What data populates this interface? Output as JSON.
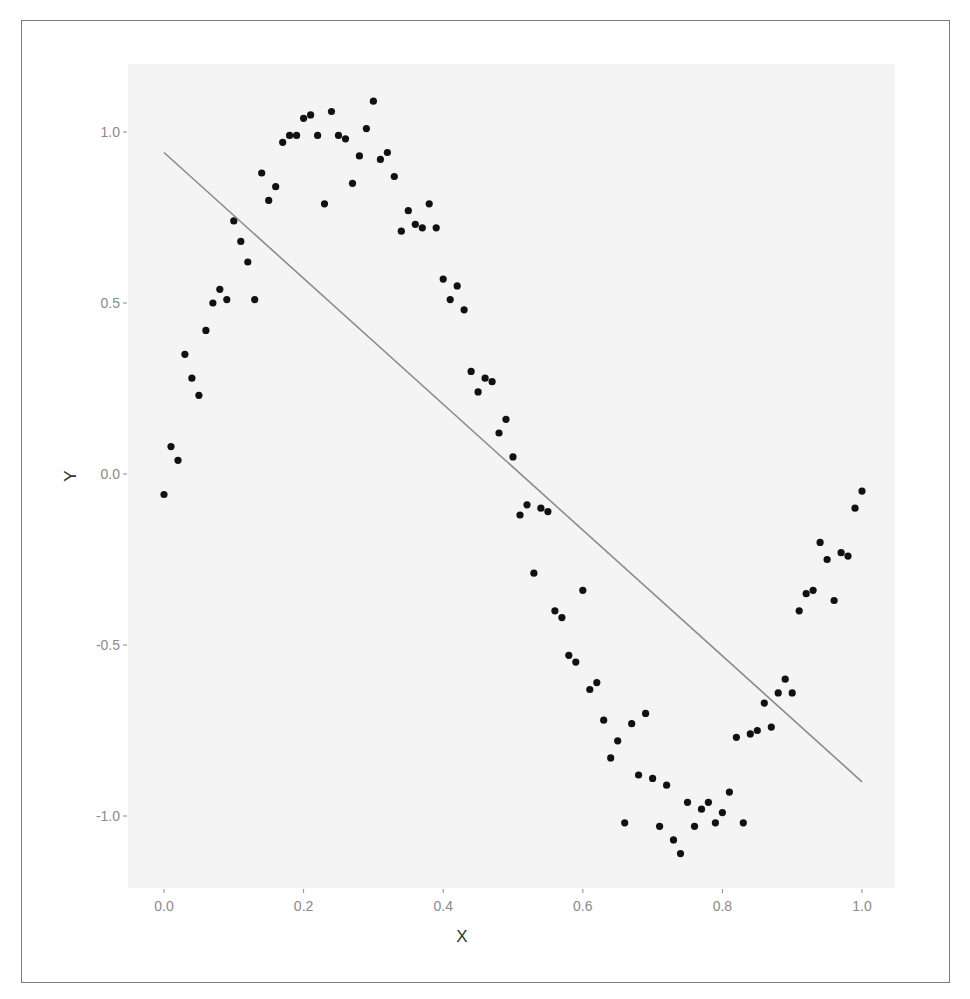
{
  "chart_data": {
    "type": "scatter",
    "title": "",
    "xlabel": "X",
    "ylabel": "Y",
    "xlim": [
      -0.05,
      1.05
    ],
    "ylim": [
      -1.21,
      1.2
    ],
    "xticks": [
      0.0,
      0.2,
      0.4,
      0.6,
      0.8,
      1.0
    ],
    "xtick_labels": [
      "0.0",
      "0.2",
      "0.4",
      "0.6",
      "0.8",
      "1.0"
    ],
    "yticks": [
      -1.0,
      -0.5,
      0.0,
      0.5,
      1.0
    ],
    "ytick_labels": [
      "-1.0",
      "-0.5",
      "0.0",
      "0.5",
      "1.0"
    ],
    "grid": false,
    "legend": null,
    "panel_background": "#f4f4f4",
    "point_color": "#111111",
    "line_color": "#8c8c8c",
    "series": [
      {
        "name": "points",
        "type": "scatter",
        "x": [
          0.0,
          0.01,
          0.02,
          0.03,
          0.04,
          0.05,
          0.06,
          0.07,
          0.08,
          0.09,
          0.1,
          0.11,
          0.12,
          0.13,
          0.14,
          0.15,
          0.16,
          0.17,
          0.18,
          0.19,
          0.2,
          0.21,
          0.22,
          0.23,
          0.24,
          0.25,
          0.26,
          0.27,
          0.28,
          0.29,
          0.3,
          0.31,
          0.32,
          0.33,
          0.34,
          0.35,
          0.36,
          0.37,
          0.38,
          0.39,
          0.4,
          0.41,
          0.42,
          0.43,
          0.44,
          0.45,
          0.46,
          0.47,
          0.48,
          0.49,
          0.5,
          0.51,
          0.52,
          0.53,
          0.54,
          0.55,
          0.56,
          0.57,
          0.58,
          0.59,
          0.6,
          0.61,
          0.62,
          0.63,
          0.64,
          0.65,
          0.66,
          0.67,
          0.68,
          0.69,
          0.7,
          0.71,
          0.72,
          0.73,
          0.74,
          0.75,
          0.76,
          0.77,
          0.78,
          0.79,
          0.8,
          0.81,
          0.82,
          0.83,
          0.84,
          0.85,
          0.86,
          0.87,
          0.88,
          0.89,
          0.9,
          0.91,
          0.92,
          0.93,
          0.94,
          0.95,
          0.96,
          0.97,
          0.98,
          0.99,
          1.0
        ],
        "y": [
          -0.06,
          0.08,
          0.04,
          0.35,
          0.28,
          0.23,
          0.42,
          0.5,
          0.54,
          0.51,
          0.74,
          0.68,
          0.62,
          0.51,
          0.88,
          0.8,
          0.84,
          0.97,
          0.99,
          0.99,
          1.04,
          1.05,
          0.99,
          0.79,
          1.06,
          0.99,
          0.98,
          0.85,
          0.93,
          1.01,
          1.09,
          0.92,
          0.94,
          0.87,
          0.71,
          0.77,
          0.73,
          0.72,
          0.79,
          0.72,
          0.57,
          0.51,
          0.55,
          0.48,
          0.3,
          0.24,
          0.28,
          0.27,
          0.12,
          0.16,
          0.05,
          -0.12,
          -0.09,
          -0.29,
          -0.1,
          -0.11,
          -0.4,
          -0.42,
          -0.53,
          -0.55,
          -0.34,
          -0.63,
          -0.61,
          -0.72,
          -0.83,
          -0.78,
          -1.02,
          -0.73,
          -0.88,
          -0.7,
          -0.89,
          -1.03,
          -0.91,
          -1.07,
          -1.11,
          -0.96,
          -1.03,
          -0.98,
          -0.96,
          -1.02,
          -0.99,
          -0.93,
          -0.77,
          -1.02,
          -0.76,
          -0.75,
          -0.67,
          -0.74,
          -0.64,
          -0.6,
          -0.64,
          -0.4,
          -0.35,
          -0.34,
          -0.2,
          -0.25,
          -0.37,
          -0.23,
          -0.24,
          -0.1,
          -0.05
        ]
      },
      {
        "name": "linear fit",
        "type": "line",
        "x": [
          0.0,
          1.0
        ],
        "y": [
          0.94,
          -0.9
        ]
      }
    ]
  }
}
